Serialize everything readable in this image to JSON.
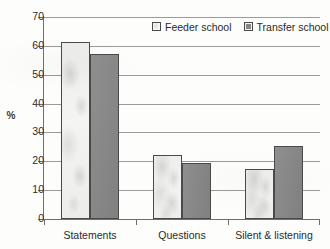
{
  "chart_data": {
    "type": "bar",
    "title": "",
    "subtitle": "",
    "xlabel": "",
    "ylabel": "%",
    "ylim": [
      0,
      70
    ],
    "ytick_step": 10,
    "yticks": [
      "70",
      "60",
      "50",
      "40",
      "30",
      "20",
      "10",
      "0"
    ],
    "grid": "horizontal",
    "legend_position": "top-right-inside",
    "categories": [
      "Statements",
      "Questions",
      "Silent & listening"
    ],
    "series": [
      {
        "name": "Feeder school",
        "color": "#f4f4f2",
        "border_color": "#4a4a4a",
        "values": [
          61,
          22,
          17
        ]
      },
      {
        "name": "Transfer school",
        "color": "#878787",
        "border_color": "#4a4a4a",
        "values": [
          57,
          19,
          25
        ]
      }
    ]
  },
  "legend": {
    "entries": [
      {
        "label": "Feeder school",
        "swatch": "legend-swatch-light"
      },
      {
        "label": "Transfer school",
        "swatch": "legend-swatch-gray"
      }
    ]
  },
  "axes": {
    "y_title": "%",
    "y_tick_labels": [
      "70",
      "60",
      "50",
      "40",
      "30",
      "20",
      "10",
      "0"
    ],
    "x_tick_labels": [
      "Statements",
      "Questions",
      "Silent & listening"
    ]
  },
  "colors": {
    "axis": "#6f6f6f",
    "gridline": "#9a9a9a",
    "text": "#2b2b2b",
    "series_feeder": "#f4f4f2",
    "series_transfer": "#878787",
    "background": "#fdfdfc"
  }
}
